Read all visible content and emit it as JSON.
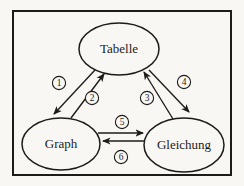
{
  "figure": {
    "canvas": {
      "width": 244,
      "height": 186,
      "paper_color": "#f8f7f3",
      "ink_color": "#1d1c1a"
    },
    "frame": {
      "x": 13,
      "y": 11,
      "width": 218,
      "height": 164,
      "stroke_width": 2
    },
    "node_font_size": 13,
    "badge_font_size": 9.5,
    "badge_radius": 6.6,
    "nodes": [
      {
        "id": "tabelle",
        "label": "Tabelle",
        "cx": 119,
        "cy": 49,
        "rx": 40,
        "ry": 26
      },
      {
        "id": "graph",
        "label": "Graph",
        "cx": 61,
        "cy": 144,
        "rx": 39,
        "ry": 26
      },
      {
        "id": "gleichung",
        "label": "Gleichung",
        "cx": 184,
        "cy": 145,
        "rx": 40,
        "ry": 27
      }
    ],
    "edges": [
      {
        "number": "1",
        "from": "tabelle",
        "to": "graph",
        "x1": 95,
        "y1": 70,
        "x2": 54,
        "y2": 114,
        "badge_cx": 59,
        "badge_cy": 83
      },
      {
        "number": "2",
        "from": "graph",
        "to": "tabelle",
        "x1": 71,
        "y1": 118,
        "x2": 104,
        "y2": 74,
        "badge_cx": 92,
        "badge_cy": 98
      },
      {
        "number": "3",
        "from": "gleichung",
        "to": "tabelle",
        "x1": 173,
        "y1": 119,
        "x2": 144,
        "y2": 72,
        "badge_cx": 147,
        "badge_cy": 98
      },
      {
        "number": "4",
        "from": "tabelle",
        "to": "gleichung",
        "x1": 149,
        "y1": 70,
        "x2": 189,
        "y2": 112,
        "badge_cx": 184,
        "badge_cy": 82
      },
      {
        "number": "5",
        "from": "graph",
        "to": "gleichung",
        "x1": 98,
        "y1": 133,
        "x2": 143,
        "y2": 133,
        "badge_cx": 122,
        "badge_cy": 122
      },
      {
        "number": "6",
        "from": "gleichung",
        "to": "graph",
        "x1": 145,
        "y1": 141,
        "x2": 103,
        "y2": 141,
        "badge_cx": 121,
        "badge_cy": 157
      }
    ]
  }
}
